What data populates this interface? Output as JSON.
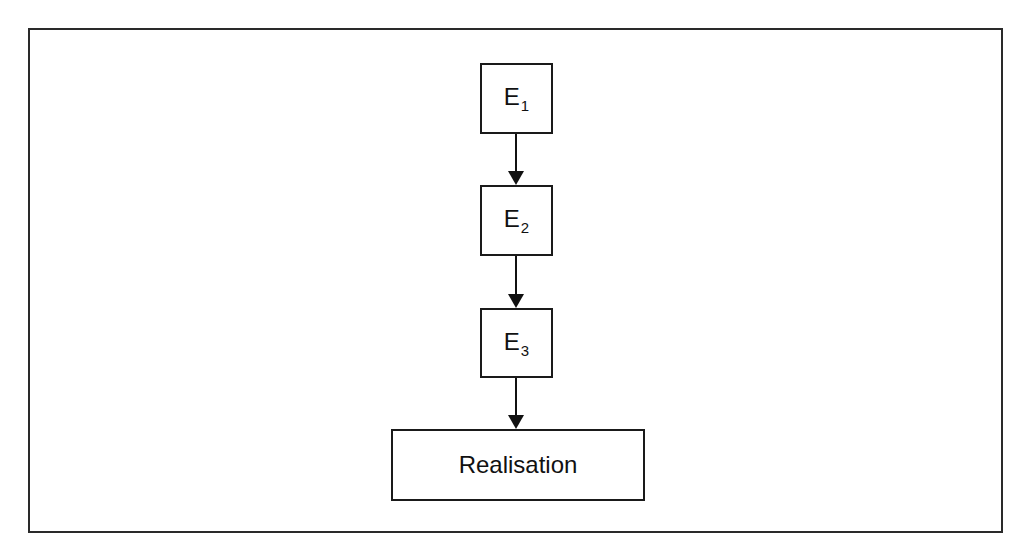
{
  "diagram": {
    "type": "flowchart",
    "direction": "top-to-bottom",
    "nodes": [
      {
        "id": "E1",
        "base": "E",
        "subscript": "1"
      },
      {
        "id": "E2",
        "base": "E",
        "subscript": "2"
      },
      {
        "id": "E3",
        "base": "E",
        "subscript": "3"
      },
      {
        "id": "realisation",
        "label": "Realisation"
      }
    ],
    "edges": [
      {
        "from": "E1",
        "to": "E2"
      },
      {
        "from": "E2",
        "to": "E3"
      },
      {
        "from": "E3",
        "to": "realisation"
      }
    ],
    "colors": {
      "stroke": "#111111",
      "background": "#ffffff"
    }
  }
}
